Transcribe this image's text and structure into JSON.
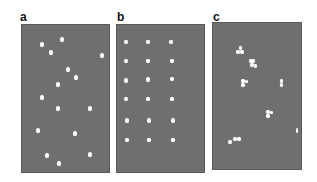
{
  "figure": {
    "background": "#ffffff",
    "panel_color": "#6f6f6f",
    "dot_color": "#ffffff",
    "panels": [
      {
        "id": "a",
        "label": "a",
        "pattern": "random",
        "label_pos": [
          20,
          11
        ],
        "rect": [
          21,
          24,
          89,
          149
        ],
        "dots": [
          [
            42,
            44,
            4,
            5
          ],
          [
            62,
            39,
            4,
            5
          ],
          [
            51,
            52,
            4,
            5
          ],
          [
            102,
            55,
            4,
            5
          ],
          [
            68,
            69,
            4,
            5
          ],
          [
            76,
            77,
            4,
            5
          ],
          [
            58,
            84,
            4,
            5
          ],
          [
            42,
            97,
            4,
            5
          ],
          [
            58,
            108,
            4,
            5
          ],
          [
            90,
            108,
            4,
            5
          ],
          [
            38,
            130,
            4,
            5
          ],
          [
            75,
            133,
            4,
            5
          ],
          [
            47,
            155,
            4,
            5
          ],
          [
            90,
            154,
            4,
            5
          ],
          [
            59,
            163,
            4,
            5
          ]
        ]
      },
      {
        "id": "b",
        "label": "b",
        "pattern": "regular grid",
        "label_pos": [
          117,
          11
        ],
        "rect": [
          116,
          24,
          89,
          149
        ],
        "dots": [
          [
            126,
            42,
            4,
            4
          ],
          [
            148,
            42,
            4,
            4
          ],
          [
            171,
            42,
            4,
            4
          ],
          [
            126,
            61,
            4,
            4
          ],
          [
            148,
            61,
            4,
            4
          ],
          [
            172,
            61,
            4,
            4
          ],
          [
            126,
            80,
            4,
            5
          ],
          [
            148,
            79,
            4,
            5
          ],
          [
            172,
            79,
            4,
            4
          ],
          [
            126,
            99,
            4,
            4
          ],
          [
            148,
            99,
            4,
            4
          ],
          [
            172,
            99,
            4,
            4
          ],
          [
            127,
            120,
            4,
            5
          ],
          [
            149,
            120,
            4,
            5
          ],
          [
            173,
            120,
            4,
            5
          ],
          [
            127,
            140,
            4,
            4
          ],
          [
            149,
            140,
            4,
            4
          ],
          [
            173,
            140,
            4,
            4
          ]
        ]
      },
      {
        "id": "c",
        "label": "c",
        "pattern": "clustered",
        "label_pos": [
          213,
          11
        ],
        "rect": [
          212,
          22,
          90,
          148
        ],
        "dots": [
          [
            240,
            48,
            3,
            4
          ],
          [
            238,
            52,
            4,
            4
          ],
          [
            242,
            52,
            4,
            4
          ],
          [
            250,
            61,
            3,
            4
          ],
          [
            253,
            61,
            4,
            4
          ],
          [
            252,
            65,
            4,
            4
          ],
          [
            255,
            66,
            3,
            4
          ],
          [
            243,
            81,
            4,
            4
          ],
          [
            246,
            81,
            3,
            3
          ],
          [
            243,
            85,
            4,
            4
          ],
          [
            281,
            81,
            3,
            4
          ],
          [
            281,
            85,
            3,
            4
          ],
          [
            268,
            112,
            4,
            4
          ],
          [
            271,
            112,
            3,
            3
          ],
          [
            268,
            116,
            4,
            4
          ],
          [
            297,
            130,
            2,
            5
          ],
          [
            230,
            142,
            4,
            4
          ],
          [
            235,
            139,
            4,
            4
          ],
          [
            239,
            139,
            4,
            4
          ]
        ]
      }
    ]
  }
}
